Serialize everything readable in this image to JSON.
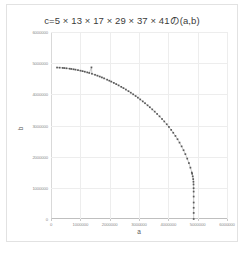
{
  "chart_data": {
    "type": "scatter",
    "title": "c=5 × 13 × 17 × 29 × 37 × 41の(a,b)",
    "xlabel": "a",
    "ylabel": "b",
    "xlim": [
      0,
      6000000
    ],
    "ylim": [
      0,
      6000000
    ],
    "grid": true,
    "legend": "none",
    "marker_color": "#595959",
    "line_color": "#a6a6a6",
    "x_ticks": [
      0,
      1000000,
      2000000,
      3000000,
      4000000,
      5000000,
      6000000
    ],
    "x_tick_labels": [
      "0",
      "1000000",
      "2000000",
      "3000000",
      "4000000",
      "5000000",
      "6000000"
    ],
    "y_ticks": [
      0,
      1000000,
      2000000,
      3000000,
      4000000,
      5000000,
      6000000
    ],
    "y_tick_labels": [
      "0",
      "1000000",
      "2000000",
      "3000000",
      "4000000",
      "5000000",
      "6000000"
    ],
    "c_value": 4864145,
    "series": [
      {
        "name": "(a,b)",
        "points": [
          [
            206359,
            4859768
          ],
          [
            293663,
            4855271
          ],
          [
            398417,
            4847801
          ],
          [
            454641,
            4842847
          ],
          [
            528529,
            4835376
          ],
          [
            634933,
            4822513
          ],
          [
            692897,
            4814529
          ],
          [
            768559,
            4803104
          ],
          [
            832847,
            4792409
          ],
          [
            919633,
            4776576
          ],
          [
            1005329,
            4759408
          ],
          [
            1076833,
            4743888
          ],
          [
            1152079,
            4725984
          ],
          [
            1237103,
            4704048
          ],
          [
            1304857,
            4685792
          ],
          [
            1379233,
            4864145
          ],
          [
            1395649,
            4659727
          ],
          [
            1500721,
            4627584
          ],
          [
            1583281,
            4599248
          ],
          [
            1661377,
            4570608
          ],
          [
            1735279,
            4542305
          ],
          [
            1810433,
            4512144
          ],
          [
            1913647,
            4470096
          ],
          [
            1988593,
            4437776
          ],
          [
            2055007,
            4408128
          ],
          [
            2141713,
            4367376
          ],
          [
            2223553,
            4327776
          ],
          [
            2304991,
            4286912
          ],
          [
            2395217,
            4240304
          ],
          [
            2470481,
            4199472
          ],
          [
            2553839,
            4152720
          ],
          [
            2641087,
            4100976
          ],
          [
            2719937,
            4052784
          ],
          [
            2801969,
            4000608
          ],
          [
            2884273,
            3946416
          ],
          [
            2961217,
            3893904
          ],
          [
            3042383,
            3836304
          ],
          [
            3127777,
            3773664
          ],
          [
            3205697,
            3714816
          ],
          [
            3291953,
            3647808
          ],
          [
            3368879,
            3586320
          ],
          [
            3452497,
            3517104
          ],
          [
            3535153,
            3445392
          ],
          [
            3618113,
            3370704
          ],
          [
            3700337,
            3293136
          ],
          [
            3785503,
            3209328
          ],
          [
            3861967,
            3130128
          ],
          [
            3945327,
            3039504
          ],
          [
            4019185,
            2954112
          ],
          [
            4096897,
            2859312
          ],
          [
            4167601,
            2767536
          ],
          [
            4241903,
            2665104
          ],
          [
            4312993,
            2560032
          ],
          [
            4381759,
            2451408
          ],
          [
            4452623,
            2330064
          ],
          [
            4518673,
            2207088
          ],
          [
            4580417,
            2081088
          ],
          [
            4644463,
            1937664
          ],
          [
            4701361,
            1794672
          ],
          [
            4753009,
            1647360
          ],
          [
            4800673,
            1489728
          ],
          [
            4811089,
            1452288
          ],
          [
            4832113,
            1368495
          ],
          [
            4848047,
            1280112
          ],
          [
            4856383,
            1195200
          ],
          [
            4859423,
            1108560
          ],
          [
            4861873,
            988560
          ],
          [
            4862929,
            880560
          ],
          [
            4863793,
            720480
          ],
          [
            4864049,
            528480
          ],
          [
            4864129,
            360240
          ],
          [
            4864143,
            194880
          ],
          [
            4864145,
            0
          ]
        ]
      }
    ]
  },
  "caption": {
    "text": ""
  }
}
